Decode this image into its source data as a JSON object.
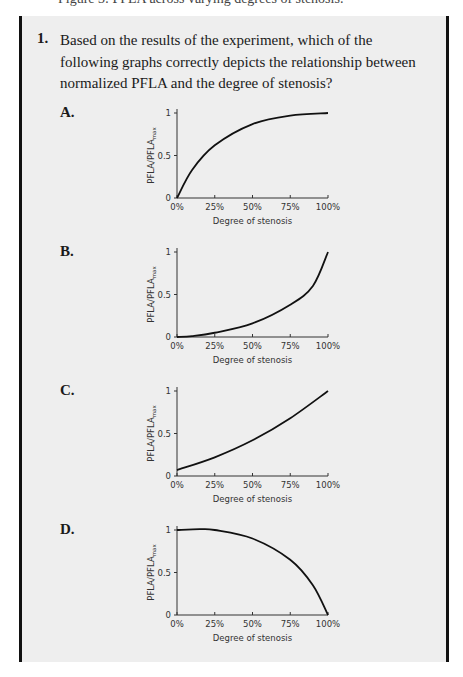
{
  "page": {
    "cut_top_line": "Figure 3: PFLA across varying degrees of stenosis."
  },
  "question": {
    "number": "1.",
    "text": "Based on the results of the experiment, which of the following graphs correctly depicts the relationship between normalized PFLA and the degree of stenosis?"
  },
  "options": [
    {
      "label": "A.",
      "ylabel_main": "PFLA/PFLA",
      "ylabel_sub": "max",
      "xlabel": "Degree of stenosis",
      "yticks": [
        "0",
        "0.5",
        "1"
      ],
      "xticks": [
        "0%",
        "25%",
        "50%",
        "75%",
        "100%"
      ]
    },
    {
      "label": "B.",
      "ylabel_main": "PFLA/PFLA",
      "ylabel_sub": "max",
      "xlabel": "Degree of stenosis",
      "yticks": [
        "0",
        "0.5",
        "1"
      ],
      "xticks": [
        "0%",
        "25%",
        "50%",
        "75%",
        "100%"
      ]
    },
    {
      "label": "C.",
      "ylabel_main": "PFLA/PFLA",
      "ylabel_sub": "max",
      "xlabel": "Degree of stenosis",
      "yticks": [
        "0",
        "0.5",
        "1"
      ],
      "xticks": [
        "0%",
        "25%",
        "50%",
        "75%",
        "100%"
      ]
    },
    {
      "label": "D.",
      "ylabel_main": "PFLA/PFLA",
      "ylabel_sub": "max",
      "xlabel": "Degree of stenosis",
      "yticks": [
        "0",
        "0.5",
        "1"
      ],
      "xticks": [
        "0%",
        "25%",
        "50%",
        "75%",
        "100%"
      ]
    }
  ],
  "chart_data": [
    {
      "type": "line",
      "title": "A.",
      "xlabel": "Degree of stenosis",
      "ylabel": "PFLA/PFLAmax",
      "x": [
        0,
        10,
        25,
        50,
        75,
        100
      ],
      "series": [
        {
          "name": "A",
          "values": [
            0,
            0.33,
            0.62,
            0.87,
            0.97,
            1.0
          ]
        }
      ],
      "xlim": [
        0,
        100
      ],
      "ylim": [
        0,
        1
      ],
      "grid": false
    },
    {
      "type": "line",
      "title": "B.",
      "xlabel": "Degree of stenosis",
      "ylabel": "PFLA/PFLAmax",
      "x": [
        0,
        10,
        25,
        50,
        75,
        90,
        100
      ],
      "series": [
        {
          "name": "B",
          "values": [
            0,
            0.01,
            0.05,
            0.16,
            0.38,
            0.6,
            1.0
          ]
        }
      ],
      "xlim": [
        0,
        100
      ],
      "ylim": [
        0,
        1
      ],
      "grid": false
    },
    {
      "type": "line",
      "title": "C.",
      "xlabel": "Degree of stenosis",
      "ylabel": "PFLA/PFLAmax",
      "x": [
        0,
        25,
        50,
        75,
        100
      ],
      "series": [
        {
          "name": "C",
          "values": [
            0.07,
            0.22,
            0.42,
            0.68,
            1.0
          ]
        }
      ],
      "xlim": [
        0,
        100
      ],
      "ylim": [
        0,
        1
      ],
      "grid": false
    },
    {
      "type": "line",
      "title": "D.",
      "xlabel": "Degree of stenosis",
      "ylabel": "PFLA/PFLAmax",
      "x": [
        0,
        15,
        25,
        50,
        75,
        90,
        100
      ],
      "series": [
        {
          "name": "D",
          "values": [
            1.0,
            1.01,
            1.0,
            0.9,
            0.65,
            0.35,
            0
          ]
        }
      ],
      "xlim": [
        0,
        100
      ],
      "ylim": [
        0,
        1
      ],
      "grid": false
    }
  ]
}
